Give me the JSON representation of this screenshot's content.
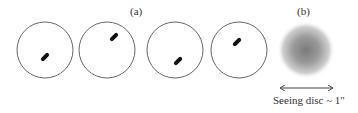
{
  "figure": {
    "label_a": "(a)",
    "label_b": "(b)",
    "caption": "Seeing disc ~ 1\"",
    "colors": {
      "circle_stroke": "#555555",
      "speckle": "#111111",
      "blob_center": "#777777",
      "text": "#333333"
    },
    "panels_a": [
      {
        "cx": 45,
        "cy": 50,
        "r": 28,
        "speckle": {
          "x": 45,
          "y": 57,
          "angle": -45
        }
      },
      {
        "cx": 107,
        "cy": 50,
        "r": 28,
        "speckle": {
          "x": 114,
          "y": 37,
          "angle": -45
        }
      },
      {
        "cx": 175,
        "cy": 50,
        "r": 28,
        "speckle": {
          "x": 178,
          "y": 61,
          "angle": -45
        }
      },
      {
        "cx": 239,
        "cy": 50,
        "r": 28,
        "speckle": {
          "x": 237,
          "y": 42,
          "angle": -45
        }
      }
    ],
    "panel_b": {
      "cx": 306,
      "cy": 50,
      "r": 29
    },
    "arrow": {
      "x1": 280,
      "x2": 333,
      "y": 88
    }
  }
}
